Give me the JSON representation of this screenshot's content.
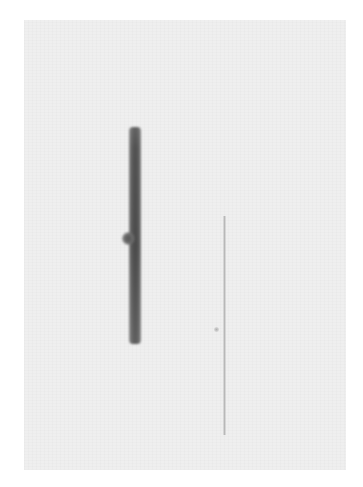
{
  "image": {
    "background_color": "#ffffff",
    "panel": {
      "color": "#efefef",
      "left": 24,
      "top": 20,
      "width": 322,
      "height": 450
    },
    "lanes": [
      {
        "name": "dark-lane",
        "color": "#555555",
        "left": 129,
        "top": 127,
        "width": 12,
        "height": 217
      },
      {
        "name": "faint-lane",
        "color": "#b8b8b8",
        "left": 223,
        "top": 216,
        "width": 3,
        "height": 219
      }
    ],
    "spots": [
      {
        "name": "dark-lane-spot",
        "color": "#555555",
        "left": 122,
        "top": 232,
        "size": 13
      },
      {
        "name": "faint-lane-spot",
        "color": "#b0b0b0",
        "left": 214,
        "top": 327,
        "size": 5
      }
    ]
  }
}
